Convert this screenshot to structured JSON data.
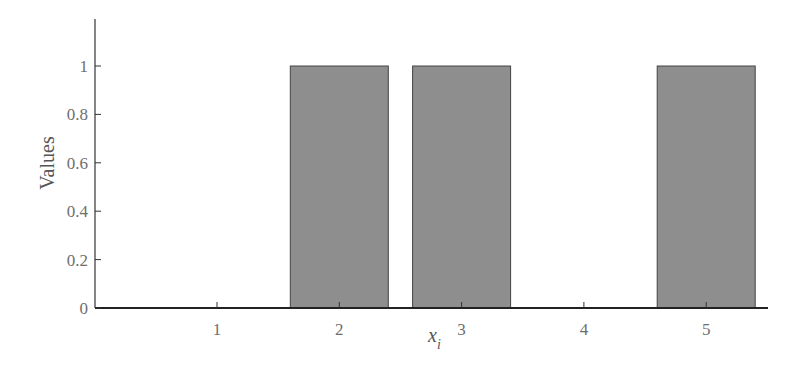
{
  "chart_data": {
    "type": "bar",
    "categories": [
      "1",
      "2",
      "3",
      "4",
      "5"
    ],
    "values": [
      0,
      1,
      1,
      0,
      1
    ],
    "title": "",
    "xlabel": "x_i",
    "ylabel": "Values",
    "ylim": [
      0,
      1.18
    ],
    "yticks": [
      "0",
      "0.2",
      "0.4",
      "0.6",
      "0.8",
      "1"
    ],
    "xticks": [
      "1",
      "2",
      "3",
      "4",
      "5"
    ],
    "grid": false,
    "bar_color": "#8e8e8e"
  },
  "labels": {
    "ylabel": "Values",
    "xlabel_base": "x",
    "xlabel_sub": "i"
  }
}
